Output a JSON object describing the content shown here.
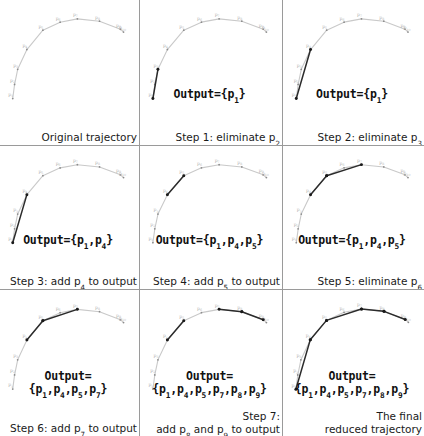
{
  "figure": {
    "rows": 3,
    "cols": 3,
    "colors": {
      "original_polyline": "#c9c9c9",
      "reduced_polyline": "#2b2b2b",
      "point_marker": "#8c8c8c",
      "reduced_point_marker": "#1a1a1a",
      "separator": "#9a9a9a",
      "text": "#1a1a1a",
      "background": "#ffffff"
    }
  },
  "points": {
    "labels": [
      "p1",
      "p2",
      "p3",
      "p4",
      "p5",
      "p6",
      "p7",
      "p8",
      "p9",
      "p10"
    ],
    "coords": [
      {
        "name": "p1",
        "x": 0.055,
        "y": 0.95
      },
      {
        "name": "p2",
        "x": 0.07,
        "y": 0.8
      },
      {
        "name": "p3",
        "x": 0.095,
        "y": 0.64
      },
      {
        "name": "p4",
        "x": 0.17,
        "y": 0.43
      },
      {
        "name": "p5",
        "x": 0.3,
        "y": 0.225
      },
      {
        "name": "p6",
        "x": 0.44,
        "y": 0.14
      },
      {
        "name": "p7",
        "x": 0.58,
        "y": 0.105
      },
      {
        "name": "p8",
        "x": 0.76,
        "y": 0.13
      },
      {
        "name": "p9",
        "x": 0.93,
        "y": 0.215
      },
      {
        "name": "p10",
        "x": 0.955,
        "y": 0.245
      }
    ]
  },
  "panels": [
    {
      "id": "panel-1",
      "caption": "Original trajectory",
      "caption_sub": "",
      "output": "",
      "output_lines": [],
      "reduced_segments": [],
      "dark_segments": []
    },
    {
      "id": "panel-2",
      "caption": "Step 1: eliminate p",
      "caption_sub": "2",
      "output_lines": [
        "Output={p<sub>1</sub>}"
      ],
      "reduced_segments": [],
      "dark_segments": [
        [
          0,
          2
        ]
      ]
    },
    {
      "id": "panel-3",
      "caption": "Step 2: eliminate p",
      "caption_sub": "3",
      "output_lines": [
        "Output={p<sub>1</sub>}"
      ],
      "reduced_segments": [],
      "dark_segments": [
        [
          0,
          3
        ]
      ]
    },
    {
      "id": "panel-4",
      "caption": "Step 3: add p",
      "caption_sub": "4",
      "caption_tail": " to output",
      "output_lines": [
        "Output={p<sub>1</sub>,p<sub>4</sub>}"
      ],
      "reduced_segments": [],
      "dark_segments": [
        [
          0,
          3
        ]
      ]
    },
    {
      "id": "panel-5",
      "caption": "Step 4: add p",
      "caption_sub": "5",
      "caption_tail": " to output",
      "output_lines": [
        "Output={p<sub>1</sub>,p<sub>4</sub>,p<sub>5</sub>}"
      ],
      "reduced_segments": [],
      "dark_segments": [
        [
          3,
          4
        ]
      ]
    },
    {
      "id": "panel-6",
      "caption": "Step 5: eliminate p",
      "caption_sub": "6",
      "output_lines": [
        "Output={p<sub>1</sub>,p<sub>4</sub>,p<sub>5</sub>}"
      ],
      "reduced_segments": [],
      "dark_segments": [
        [
          3,
          4
        ],
        [
          4,
          6
        ]
      ]
    },
    {
      "id": "panel-7",
      "caption": "Step 6: add p",
      "caption_sub": "7",
      "caption_tail": " to output",
      "output_lines": [
        "Output=",
        "{p<sub>1</sub>,p<sub>4</sub>,p<sub>5</sub>,p<sub>7</sub>}"
      ],
      "reduced_segments": [],
      "dark_segments": [
        [
          3,
          4
        ],
        [
          4,
          6
        ]
      ]
    },
    {
      "id": "panel-8",
      "caption_l1": "Step 7:",
      "caption_l2": "add p",
      "caption_sub": "8",
      "caption_l2b": " and p",
      "caption_sub2": "9",
      "caption_l2c": " to output",
      "output_lines": [
        "Output=",
        "{p<sub>1</sub>,p<sub>4</sub>,p<sub>5</sub>,p<sub>7</sub>,p<sub>8</sub>,p<sub>9</sub>}"
      ],
      "reduced_segments": [],
      "dark_segments": [
        [
          3,
          4
        ],
        [
          6,
          7
        ],
        [
          7,
          8
        ]
      ]
    },
    {
      "id": "panel-9",
      "caption_l1": "The final",
      "caption_l2": "reduced trajectory",
      "output_lines": [
        "Output=",
        "{p<sub>1</sub>,p<sub>4</sub>,p<sub>5</sub>,p<sub>7</sub>,p<sub>8</sub>,p<sub>9</sub>}"
      ],
      "reduced_segments": [
        [
          0,
          3
        ],
        [
          3,
          4
        ],
        [
          4,
          6
        ],
        [
          6,
          7
        ],
        [
          7,
          8
        ]
      ],
      "dark_segments": []
    }
  ]
}
